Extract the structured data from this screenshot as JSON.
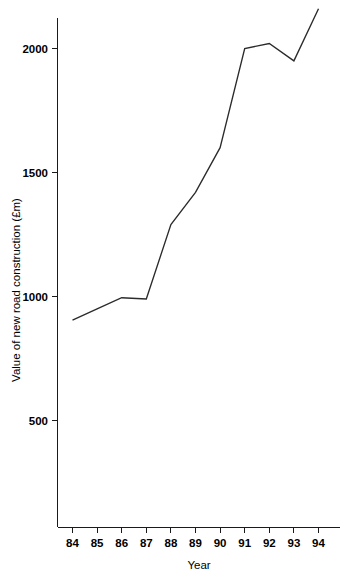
{
  "chart_data": {
    "type": "line",
    "title": "",
    "xlabel": "Year",
    "ylabel": "Value of new road construction (£m)",
    "categories": [
      "84",
      "85",
      "86",
      "87",
      "88",
      "89",
      "90",
      "91",
      "92",
      "93",
      "94"
    ],
    "values": [
      905,
      950,
      995,
      990,
      1290,
      1420,
      1600,
      2000,
      2020,
      1950,
      2160
    ],
    "series": [
      {
        "name": "Value of new road construction",
        "values": [
          905,
          950,
          995,
          990,
          1290,
          1420,
          1600,
          2000,
          2020,
          1950,
          2160
        ]
      }
    ],
    "x_tick_labels": [
      "84",
      "85",
      "86",
      "87",
      "88",
      "89",
      "90",
      "91",
      "92",
      "93",
      "94"
    ],
    "y_tick_labels": [
      "500",
      "1000",
      "1500",
      "2000"
    ],
    "y_ticks": [
      500,
      1000,
      1500,
      2000
    ],
    "ylim": [
      0,
      2230
    ],
    "xlim": [
      84,
      94
    ],
    "grid": false,
    "legend": false,
    "legend_position": "none",
    "line_color": "#2b2b2b",
    "axis_color": "#1a1a1a",
    "background_color": "#ffffff"
  },
  "axes": {
    "x_title": "Year",
    "y_title": "Value of new road construction (£m)"
  }
}
